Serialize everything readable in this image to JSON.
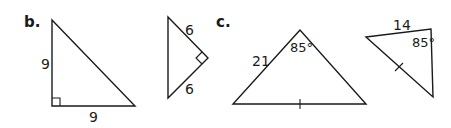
{
  "parts": {
    "b": {
      "label": "b.",
      "triangle1": {
        "leg_vertical": "9",
        "leg_horizontal": "9",
        "right_angle": true
      },
      "triangle2": {
        "side_upper": "6",
        "side_lower": "6",
        "right_angle": true
      }
    },
    "c": {
      "label": "c.",
      "triangle1": {
        "side_left": "21",
        "apex_angle": "85°",
        "tick_on_base": true
      },
      "triangle2": {
        "side_top": "14",
        "angle": "85°",
        "tick_on_hypotenuse": true
      }
    }
  },
  "colors": {
    "ink": "#1a1a1a",
    "background": "#ffffff"
  }
}
